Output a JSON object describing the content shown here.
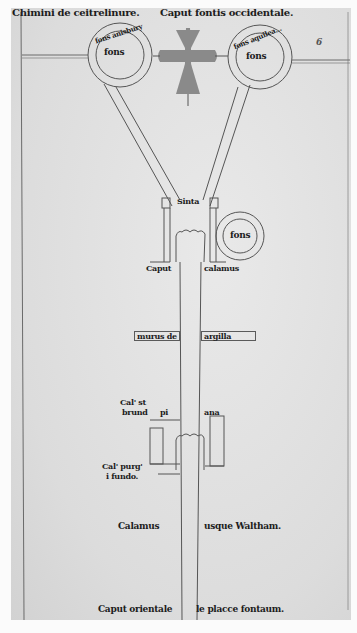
{
  "manuscript": {
    "type": "Medieval waterworks plan",
    "header": {
      "left": "Chimini de ceitrelinure.",
      "center": "Caput fontis occidentale."
    },
    "folio_mark": "6",
    "sources": {
      "left_ring_label": "fons anisbury",
      "left_ring_inner": "fons",
      "right_ring_label": "fons aquilea...",
      "right_ring_inner": "fons"
    },
    "junction": {
      "label": "Sinta",
      "side_fountain": "fons",
      "caption_left": "Caput",
      "caption_right": "calamus"
    },
    "wall_labels": {
      "left": "murus de",
      "right": "argilla"
    },
    "lower_basin": {
      "left_top": "Cal' st",
      "left_bottom": "brund",
      "mid": "pi",
      "right": "ana",
      "purge_line1": "Cal' purg'",
      "purge_line2": "i fundo."
    },
    "channel_caption": {
      "left": "Calamus",
      "right": "usque Waltham."
    },
    "footer": {
      "left": "Caput orientale",
      "right": "le placce fontaum."
    },
    "colors": {
      "parchment": "#e2e2e2",
      "ink": "#1c1c1c",
      "line": "#5a5a5a",
      "cross": "#8a8a8a"
    }
  }
}
